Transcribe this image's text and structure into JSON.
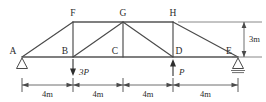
{
  "figure": {
    "type": "truss-structural-diagram",
    "stroke_color": "#4a4a4a",
    "background": "#ffffff"
  },
  "nodes": [
    {
      "id": "A",
      "label": "A",
      "x": 22,
      "y": 57,
      "label_x": 13,
      "label_y": 54
    },
    {
      "id": "B",
      "label": "B",
      "x": 73,
      "y": 57,
      "label_x": 64,
      "label_y": 54
    },
    {
      "id": "C",
      "label": "C",
      "x": 123,
      "y": 57,
      "label_x": 114,
      "label_y": 54
    },
    {
      "id": "D",
      "label": "D",
      "x": 173,
      "y": 57,
      "label_x": 176,
      "label_y": 54
    },
    {
      "id": "E",
      "label": "E",
      "x": 238,
      "y": 57,
      "label_x": 228,
      "label_y": 54
    },
    {
      "id": "F",
      "label": "F",
      "x": 73,
      "y": 22,
      "label_x": 70,
      "label_y": 16
    },
    {
      "id": "G",
      "label": "G",
      "x": 123,
      "y": 22,
      "label_x": 120,
      "label_y": 16
    },
    {
      "id": "H",
      "label": "H",
      "x": 173,
      "y": 22,
      "label_x": 170,
      "label_y": 16
    }
  ],
  "members": [
    {
      "name": "bottom-chord-A-E",
      "from": "A",
      "to": "E"
    },
    {
      "name": "top-chord-F-H",
      "from": "F",
      "to": "H"
    },
    {
      "name": "diagonal-A-F",
      "from": "A",
      "to": "F"
    },
    {
      "name": "diagonal-H-E",
      "from": "H",
      "to": "E"
    },
    {
      "name": "vertical-B-F",
      "from": "B",
      "to": "F"
    },
    {
      "name": "vertical-C-G",
      "from": "C",
      "to": "G"
    },
    {
      "name": "vertical-D-H",
      "from": "D",
      "to": "H"
    },
    {
      "name": "diagonal-B-G",
      "from": "B",
      "to": "G"
    },
    {
      "name": "diagonal-G-D",
      "from": "G",
      "to": "D"
    }
  ],
  "loads": [
    {
      "name": "load-3P-at-B",
      "label": "3P",
      "at_node": "B",
      "direction": "down",
      "x": 73,
      "label_x": 79,
      "label_y": 75
    },
    {
      "name": "load-P-at-D",
      "label": "P",
      "at_node": "D",
      "direction": "up",
      "x": 173,
      "label_x": 179,
      "label_y": 75
    }
  ],
  "supports": [
    {
      "name": "support-A",
      "type": "pin",
      "at_node": "A",
      "x": 22,
      "y": 58
    },
    {
      "name": "support-E",
      "type": "pin-hatched",
      "at_node": "E",
      "x": 238,
      "y": 58
    }
  ],
  "dimensions": {
    "horizontal": {
      "y": 85,
      "segments": [
        {
          "label": "4m",
          "from_x": 22,
          "to_x": 73,
          "label_x": 47.5,
          "label_y": 97
        },
        {
          "label": "4m",
          "from_x": 73,
          "to_x": 123,
          "label_x": 98,
          "label_y": 97
        },
        {
          "label": "4m",
          "from_x": 123,
          "to_x": 173,
          "label_x": 148,
          "label_y": 97
        },
        {
          "label": "4m",
          "from_x": 173,
          "to_x": 238,
          "label_x": 205.5,
          "label_y": 97
        }
      ]
    },
    "vertical": {
      "label": "3m",
      "x": 244,
      "top_y": 22,
      "bottom_y": 57,
      "label_x": 249,
      "label_y": 42,
      "ext_top": {
        "from_x": 178,
        "to_x": 262,
        "y": 22
      },
      "ext_bottom": {
        "from_x": 232,
        "to_x": 262,
        "y": 57
      }
    }
  }
}
